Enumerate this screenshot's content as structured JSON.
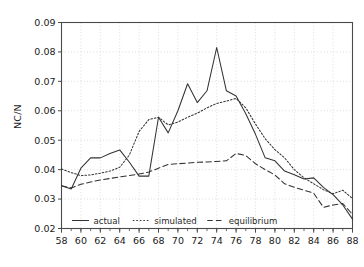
{
  "chart_data": {
    "type": "line",
    "title": "",
    "xlabel": "",
    "ylabel": "NC/N",
    "xlim": [
      58,
      88
    ],
    "ylim": [
      0.02,
      0.09
    ],
    "xticks": [
      58,
      60,
      62,
      64,
      66,
      68,
      70,
      72,
      74,
      76,
      78,
      80,
      82,
      84,
      86,
      88
    ],
    "xtick_labels": [
      "58",
      "60",
      "62",
      "64",
      "66",
      "68",
      "70",
      "72",
      "74",
      "76",
      "78",
      "80",
      "82",
      "84",
      "86",
      "88"
    ],
    "xminor_step": 1,
    "yticks": [
      0.02,
      0.03,
      0.04,
      0.05,
      0.06,
      0.07,
      0.08,
      0.09
    ],
    "ytick_labels": [
      "0.02",
      "0.03",
      "0.04",
      "0.05",
      "0.06",
      "0.07",
      "0.08",
      "0.09"
    ],
    "grid": true,
    "grid_style": "dotted",
    "legend_position": "bottom-left-inside",
    "x": [
      58,
      59,
      60,
      61,
      62,
      63,
      64,
      65,
      66,
      67,
      68,
      69,
      70,
      71,
      72,
      73,
      74,
      75,
      76,
      77,
      78,
      79,
      80,
      81,
      82,
      83,
      84,
      85,
      86,
      87,
      88
    ],
    "series": [
      {
        "name": "actual",
        "style": "solid",
        "color": "#333333",
        "values": [
          0.0345,
          0.0334,
          0.0405,
          0.044,
          0.044,
          0.0455,
          0.0467,
          0.0425,
          0.0378,
          0.0378,
          0.0578,
          0.0525,
          0.06,
          0.0692,
          0.0628,
          0.0668,
          0.0815,
          0.0668,
          0.065,
          0.059,
          0.052,
          0.044,
          0.043,
          0.0395,
          0.0383,
          0.0368,
          0.0372,
          0.034,
          0.0315,
          0.028,
          0.0232
        ]
      },
      {
        "name": "simulated",
        "style": "dotted",
        "color": "#333333",
        "values": [
          0.0402,
          0.039,
          0.038,
          0.0382,
          0.0388,
          0.0395,
          0.0408,
          0.045,
          0.053,
          0.057,
          0.0578,
          0.0552,
          0.0562,
          0.0578,
          0.0592,
          0.061,
          0.0625,
          0.0633,
          0.0642,
          0.061,
          0.0555,
          0.0505,
          0.0468,
          0.044,
          0.04,
          0.0372,
          0.0352,
          0.0332,
          0.0318,
          0.033,
          0.0302
        ]
      },
      {
        "name": "equilibrium",
        "style": "dashed",
        "color": "#333333",
        "values": [
          0.0345,
          0.0338,
          0.035,
          0.0358,
          0.0365,
          0.037,
          0.0375,
          0.038,
          0.0385,
          0.0392,
          0.0405,
          0.0418,
          0.042,
          0.0422,
          0.0425,
          0.0426,
          0.0428,
          0.043,
          0.0455,
          0.0448,
          0.042,
          0.04,
          0.0382,
          0.0352,
          0.034,
          0.033,
          0.032,
          0.0272,
          0.028,
          0.0285,
          0.0248
        ]
      }
    ],
    "legend_entries": [
      {
        "label": "actual",
        "style": "solid"
      },
      {
        "label": "simulated",
        "style": "dotted"
      },
      {
        "label": "equilibrium",
        "style": "dashed"
      }
    ]
  }
}
